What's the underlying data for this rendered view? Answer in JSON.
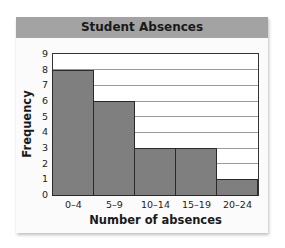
{
  "chart_data": {
    "type": "bar",
    "title": "Student Absences",
    "xlabel": "Number of absences",
    "ylabel": "Frequency",
    "categories": [
      "0–4",
      "5–9",
      "10–14",
      "15–19",
      "20–24"
    ],
    "values": [
      8,
      6,
      3,
      3,
      1
    ],
    "yticks": [
      "0",
      "1",
      "2",
      "3",
      "4",
      "5",
      "6",
      "7",
      "8",
      "9"
    ],
    "ylim": [
      0,
      9
    ],
    "grid": true,
    "histogram": true,
    "colors": {
      "bar": "#7f7f7f",
      "header": "#a3a3a3"
    }
  }
}
